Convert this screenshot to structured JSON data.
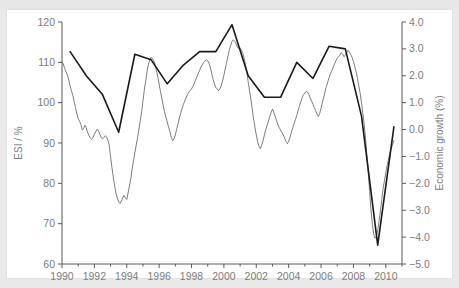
{
  "figure": {
    "background_color": "#e9e9e9",
    "panel_color": "#ffffff",
    "cut_title": "",
    "left_axis_title": "ESI / %",
    "right_axis_title": "Economic growth (%)"
  },
  "chart_data": {
    "type": "line",
    "title": "",
    "subtitle": "",
    "xlabel": "",
    "ylabel": "ESI / %",
    "y2label": "Economic growth (%)",
    "xlim": [
      1990.0,
      2011.0
    ],
    "ylim": [
      60,
      120
    ],
    "y2lim": [
      -5.0,
      4.0
    ],
    "grid": false,
    "legend": "none",
    "x_ticks_major": [
      1990,
      1992,
      1994,
      1996,
      1998,
      2000,
      2002,
      2004,
      2006,
      2008,
      2010
    ],
    "x_tick_labels": [
      "1990",
      "1992",
      "1994",
      "1996",
      "1998",
      "2000",
      "2002",
      "2004",
      "2006",
      "2008",
      "2010"
    ],
    "x_ticks_minor": [
      1991,
      1993,
      1995,
      1997,
      1999,
      2001,
      2003,
      2005,
      2007,
      2009,
      2011
    ],
    "y_ticks": [
      60,
      70,
      80,
      90,
      100,
      110,
      120
    ],
    "y_tick_labels": [
      "60",
      "70",
      "80",
      "90",
      "100",
      "110",
      "120"
    ],
    "y2_ticks": [
      -5.0,
      -4.0,
      -3.0,
      -2.0,
      -1.0,
      0.0,
      1.0,
      2.0,
      3.0,
      4.0
    ],
    "y2_tick_labels": [
      "−5.0",
      "−4.0",
      "−3.0",
      "−2.0",
      "−1.0",
      "0.0",
      "1.0",
      "2.0",
      "3.0",
      "4.0"
    ],
    "series": [
      {
        "name": "ESI",
        "axis": "left",
        "color": "#6e6e6e",
        "line_width": 0.9,
        "units": "%",
        "x": [
          1990.0,
          1990.08,
          1990.17,
          1990.25,
          1990.33,
          1990.42,
          1990.5,
          1990.58,
          1990.67,
          1990.75,
          1990.83,
          1990.92,
          1991.0,
          1991.08,
          1991.17,
          1991.25,
          1991.33,
          1991.42,
          1991.5,
          1991.58,
          1991.67,
          1991.75,
          1991.83,
          1991.92,
          1992.0,
          1992.08,
          1992.17,
          1992.25,
          1992.33,
          1992.42,
          1992.5,
          1992.58,
          1992.67,
          1992.75,
          1992.83,
          1992.92,
          1993.0,
          1993.08,
          1993.17,
          1993.25,
          1993.33,
          1993.42,
          1993.5,
          1993.58,
          1993.67,
          1993.75,
          1993.83,
          1993.92,
          1994.0,
          1994.08,
          1994.17,
          1994.25,
          1994.33,
          1994.42,
          1994.5,
          1994.58,
          1994.67,
          1994.75,
          1994.83,
          1994.92,
          1995.0,
          1995.08,
          1995.17,
          1995.25,
          1995.33,
          1995.42,
          1995.5,
          1995.58,
          1995.67,
          1995.75,
          1995.83,
          1995.92,
          1996.0,
          1996.08,
          1996.17,
          1996.25,
          1996.33,
          1996.42,
          1996.5,
          1996.58,
          1996.67,
          1996.75,
          1996.83,
          1996.92,
          1997.0,
          1997.08,
          1997.17,
          1997.25,
          1997.33,
          1997.42,
          1997.5,
          1997.58,
          1997.67,
          1997.75,
          1997.83,
          1997.92,
          1998.0,
          1998.08,
          1998.17,
          1998.25,
          1998.33,
          1998.42,
          1998.5,
          1998.58,
          1998.67,
          1998.75,
          1998.83,
          1998.92,
          1999.0,
          1999.08,
          1999.17,
          1999.25,
          1999.33,
          1999.42,
          1999.5,
          1999.58,
          1999.67,
          1999.75,
          1999.83,
          1999.92,
          2000.0,
          2000.08,
          2000.17,
          2000.25,
          2000.33,
          2000.42,
          2000.5,
          2000.58,
          2000.67,
          2000.75,
          2000.83,
          2000.92,
          2001.0,
          2001.08,
          2001.17,
          2001.25,
          2001.33,
          2001.42,
          2001.5,
          2001.58,
          2001.67,
          2001.75,
          2001.83,
          2001.92,
          2002.0,
          2002.08,
          2002.17,
          2002.25,
          2002.33,
          2002.42,
          2002.5,
          2002.58,
          2002.67,
          2002.75,
          2002.83,
          2002.92,
          2003.0,
          2003.08,
          2003.17,
          2003.25,
          2003.33,
          2003.42,
          2003.5,
          2003.58,
          2003.67,
          2003.75,
          2003.83,
          2003.92,
          2004.0,
          2004.08,
          2004.17,
          2004.25,
          2004.33,
          2004.42,
          2004.5,
          2004.58,
          2004.67,
          2004.75,
          2004.83,
          2004.92,
          2005.0,
          2005.08,
          2005.17,
          2005.25,
          2005.33,
          2005.42,
          2005.5,
          2005.58,
          2005.67,
          2005.75,
          2005.83,
          2005.92,
          2006.0,
          2006.08,
          2006.17,
          2006.25,
          2006.33,
          2006.42,
          2006.5,
          2006.58,
          2006.67,
          2006.75,
          2006.83,
          2006.92,
          2007.0,
          2007.08,
          2007.17,
          2007.25,
          2007.33,
          2007.42,
          2007.5,
          2007.58,
          2007.67,
          2007.75,
          2007.83,
          2007.92,
          2008.0,
          2008.08,
          2008.17,
          2008.25,
          2008.33,
          2008.42,
          2008.5,
          2008.58,
          2008.67,
          2008.75,
          2008.83,
          2008.92,
          2009.0,
          2009.08,
          2009.17,
          2009.25,
          2009.33,
          2009.42,
          2009.5,
          2009.58,
          2009.67,
          2009.75,
          2009.83,
          2009.92,
          2010.0,
          2010.08,
          2010.17,
          2010.25,
          2010.33,
          2010.42,
          2010.5
        ],
        "y": [
          110.2,
          109.6,
          108.4,
          107.6,
          106.9,
          105.6,
          104.2,
          103.0,
          101.8,
          100.3,
          98.8,
          97.2,
          96.0,
          95.4,
          94.6,
          93.2,
          93.6,
          94.4,
          93.8,
          92.6,
          91.8,
          91.2,
          90.9,
          91.4,
          92.2,
          92.8,
          93.4,
          93.0,
          92.2,
          91.4,
          91.0,
          91.3,
          91.8,
          91.5,
          90.8,
          89.4,
          86.6,
          84.0,
          81.6,
          79.4,
          77.6,
          76.4,
          75.4,
          75.0,
          75.6,
          76.4,
          77.0,
          76.4,
          76.0,
          77.6,
          79.4,
          81.2,
          83.6,
          85.6,
          87.6,
          89.4,
          91.4,
          93.4,
          95.4,
          97.8,
          100.4,
          103.0,
          105.4,
          107.6,
          109.4,
          110.6,
          111.2,
          111.0,
          110.4,
          109.4,
          108.0,
          106.4,
          104.6,
          102.8,
          101.0,
          99.4,
          97.8,
          96.4,
          95.2,
          94.0,
          92.8,
          91.4,
          90.6,
          91.0,
          92.0,
          93.4,
          94.8,
          96.2,
          97.4,
          98.6,
          99.6,
          100.4,
          101.2,
          102.0,
          102.6,
          103.0,
          103.4,
          104.0,
          104.8,
          105.6,
          106.4,
          107.2,
          108.0,
          108.8,
          109.4,
          110.0,
          110.4,
          110.6,
          110.4,
          109.8,
          108.6,
          107.2,
          105.8,
          104.6,
          103.8,
          103.4,
          103.0,
          103.4,
          104.2,
          105.4,
          106.8,
          108.4,
          110.0,
          111.6,
          113.0,
          114.2,
          115.2,
          115.6,
          115.2,
          114.6,
          113.8,
          113.4,
          113.6,
          113.0,
          112.2,
          111.0,
          109.4,
          107.4,
          105.2,
          103.0,
          100.8,
          98.4,
          96.0,
          93.8,
          92.0,
          90.4,
          89.2,
          88.6,
          89.4,
          90.6,
          92.0,
          93.2,
          94.4,
          95.4,
          96.6,
          97.6,
          98.4,
          97.6,
          96.6,
          95.6,
          94.6,
          93.8,
          93.2,
          92.6,
          92.0,
          91.2,
          90.4,
          89.8,
          90.4,
          91.4,
          92.6,
          93.8,
          94.8,
          95.8,
          96.8,
          98.0,
          99.2,
          100.2,
          101.2,
          102.0,
          102.4,
          102.8,
          102.6,
          102.0,
          101.2,
          100.4,
          99.6,
          98.8,
          98.0,
          97.2,
          96.6,
          97.4,
          98.6,
          100.0,
          101.4,
          102.8,
          104.0,
          105.2,
          106.2,
          107.2,
          108.0,
          108.8,
          109.6,
          110.4,
          111.0,
          111.4,
          111.8,
          112.4,
          112.0,
          111.4,
          111.8,
          112.4,
          113.0,
          112.6,
          112.0,
          111.2,
          110.2,
          109.0,
          107.6,
          106.0,
          104.2,
          102.2,
          100.0,
          97.4,
          94.4,
          91.0,
          87.0,
          82.6,
          78.0,
          73.6,
          69.8,
          67.4,
          66.4,
          66.8,
          68.4,
          70.6,
          73.2,
          76.0,
          78.6,
          80.8,
          82.6,
          84.4,
          86.0,
          87.4,
          88.6,
          89.6,
          90.6
        ]
      },
      {
        "name": "Economic growth",
        "axis": "right",
        "color": "#1a1a1a",
        "line_width": 1.6,
        "units": "%",
        "x": [
          1990.5,
          1991.5,
          1992.5,
          1993.5,
          1994.5,
          1995.5,
          1996.5,
          1997.5,
          1998.5,
          1999.5,
          2000.5,
          2001.5,
          2002.5,
          2003.5,
          2004.5,
          2005.5,
          2006.5,
          2007.5,
          2008.5,
          2009.5,
          2010.5
        ],
        "y": [
          2.9,
          2.0,
          1.3,
          -0.1,
          2.8,
          2.6,
          1.7,
          2.4,
          2.9,
          2.9,
          3.9,
          2.0,
          1.2,
          1.2,
          2.5,
          1.9,
          3.1,
          3.0,
          0.5,
          -4.3,
          0.1
        ]
      }
    ],
    "annotations": []
  }
}
